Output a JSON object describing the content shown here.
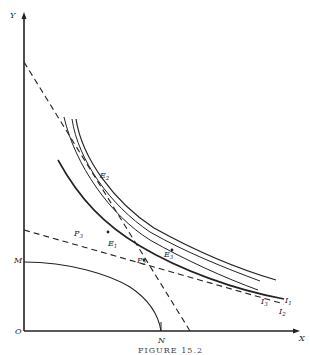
{
  "figure": {
    "caption": "FIGURE 15.2",
    "axes": {
      "y_label": "Y",
      "x_label": "X",
      "origin_label": "O"
    },
    "points": {
      "M": "M",
      "N": "N",
      "P3": {
        "base": "P",
        "sub": "3"
      },
      "P2": {
        "base": "P",
        "sub": "2"
      },
      "E1": {
        "base": "E",
        "sub": "1"
      },
      "E2": {
        "base": "E",
        "sub": "2"
      },
      "E3": {
        "base": "E",
        "sub": "3"
      }
    },
    "curves": {
      "I3": {
        "base": "I",
        "sub": "3"
      },
      "I2": {
        "base": "I",
        "sub": "2"
      },
      "I1": {
        "base": "I",
        "sub": "1"
      }
    }
  }
}
